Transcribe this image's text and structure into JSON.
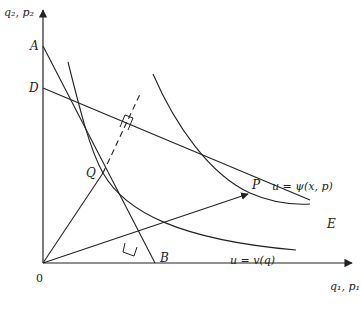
{
  "diagram": {
    "type": "economics-indifference-diagram",
    "axes": {
      "y_label": "q₂, p₂",
      "x_label": "q₁, p₁",
      "origin_label": "0"
    },
    "points": {
      "A": "A",
      "D": "D",
      "B": "B",
      "E": "E",
      "Q": "Q",
      "P": "P"
    },
    "curves": {
      "direct_utility": "u = v(q)",
      "indirect_utility": "u = ψ(x, p)"
    },
    "colors": {
      "ink": "#222222",
      "background": "#ffffff"
    }
  }
}
